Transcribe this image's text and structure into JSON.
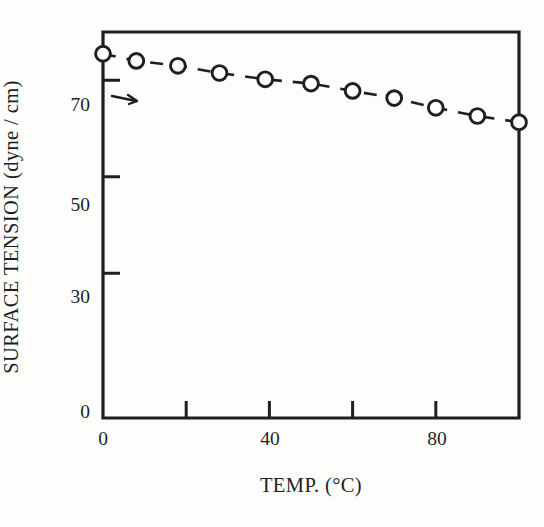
{
  "figure": {
    "background_color": "#fdfdfb",
    "ink_color": "#1f1f1f"
  },
  "chart_data": {
    "type": "line",
    "title": "",
    "subtitle": "",
    "xlabel": "TEMP. (°C)",
    "ylabel": "SURFACE TENSION (dyne / cm)",
    "xlim": [
      0,
      100
    ],
    "ylim": [
      0,
      80
    ],
    "xticks": [
      0,
      20,
      40,
      60,
      80,
      100
    ],
    "xtick_labels": [
      "0",
      "",
      "40",
      "",
      "80",
      ""
    ],
    "yticks": [
      0,
      30,
      50,
      70
    ],
    "ytick_labels": [
      "0",
      "30",
      "50",
      "70"
    ],
    "grid": false,
    "legend": null,
    "marker": "open-circle",
    "linestyle": "dashed",
    "series": [
      {
        "name": "surface tension",
        "x": [
          0,
          8,
          18,
          28,
          39,
          50,
          60,
          70,
          80,
          90,
          100
        ],
        "y": [
          75.5,
          74.0,
          73.0,
          71.5,
          70.2,
          69.3,
          67.8,
          66.3,
          64.3,
          62.6,
          61.3
        ]
      }
    ],
    "annotations": [
      {
        "name": "arrow-to-axis",
        "text": "",
        "x": 4,
        "y": 74.8
      }
    ]
  },
  "axis_labels": {
    "y": {
      "t70": "70",
      "t50": "50",
      "t30": "30",
      "t0": "0"
    },
    "x": {
      "t0": "0",
      "t40": "40",
      "t80": "80"
    }
  }
}
